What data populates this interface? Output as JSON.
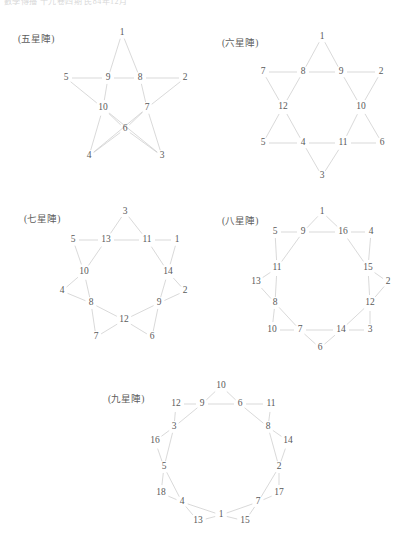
{
  "page": {
    "clipped_header": "數學傳播 十九卷四期 民84年12月",
    "background_color": "#ffffff",
    "edge_color": "#c9c9c9",
    "label_color": "#5a5a5a"
  },
  "figures": [
    {
      "id": "pentagram",
      "caption": "(五星陣)",
      "caption_x": 18,
      "caption_y": 38,
      "origin_x": 0,
      "origin_y": 0,
      "width": 208,
      "height": 180,
      "nodes": [
        {
          "label": "1",
          "x": 122,
          "y": 33
        },
        {
          "label": "5",
          "x": 66,
          "y": 78
        },
        {
          "label": "9",
          "x": 108,
          "y": 78
        },
        {
          "label": "8",
          "x": 140,
          "y": 78
        },
        {
          "label": "2",
          "x": 185,
          "y": 78
        },
        {
          "label": "10",
          "x": 103,
          "y": 108
        },
        {
          "label": "7",
          "x": 147,
          "y": 108
        },
        {
          "label": "6",
          "x": 125,
          "y": 129
        },
        {
          "label": "4",
          "x": 89,
          "y": 156
        },
        {
          "label": "3",
          "x": 162,
          "y": 156
        }
      ],
      "edges": [
        [
          "1",
          "9"
        ],
        [
          "1",
          "8"
        ],
        [
          "5",
          "9"
        ],
        [
          "9",
          "8"
        ],
        [
          "8",
          "2"
        ],
        [
          "5",
          "10"
        ],
        [
          "2",
          "7"
        ],
        [
          "9",
          "10"
        ],
        [
          "8",
          "7"
        ],
        [
          "10",
          "6"
        ],
        [
          "7",
          "6"
        ],
        [
          "10",
          "4"
        ],
        [
          "10",
          "3"
        ],
        [
          "7",
          "4"
        ],
        [
          "7",
          "3"
        ],
        [
          "6",
          "4"
        ],
        [
          "6",
          "3"
        ]
      ]
    },
    {
      "id": "hexagram",
      "caption": "(六星陣)",
      "caption_x": 222,
      "caption_y": 42,
      "origin_x": 208,
      "origin_y": 0,
      "width": 208,
      "height": 190,
      "nodes": [
        {
          "label": "1",
          "x": 322,
          "y": 37
        },
        {
          "label": "7",
          "x": 263,
          "y": 72
        },
        {
          "label": "8",
          "x": 303,
          "y": 72
        },
        {
          "label": "9",
          "x": 341,
          "y": 72
        },
        {
          "label": "2",
          "x": 381,
          "y": 72
        },
        {
          "label": "12",
          "x": 283,
          "y": 107
        },
        {
          "label": "10",
          "x": 361,
          "y": 107
        },
        {
          "label": "5",
          "x": 263,
          "y": 143
        },
        {
          "label": "4",
          "x": 303,
          "y": 143
        },
        {
          "label": "11",
          "x": 343,
          "y": 143
        },
        {
          "label": "6",
          "x": 382,
          "y": 143
        },
        {
          "label": "3",
          "x": 322,
          "y": 176
        }
      ],
      "edges": [
        [
          "1",
          "8"
        ],
        [
          "1",
          "9"
        ],
        [
          "7",
          "8"
        ],
        [
          "8",
          "9"
        ],
        [
          "9",
          "2"
        ],
        [
          "7",
          "12"
        ],
        [
          "8",
          "12"
        ],
        [
          "9",
          "10"
        ],
        [
          "2",
          "10"
        ],
        [
          "12",
          "5"
        ],
        [
          "12",
          "4"
        ],
        [
          "10",
          "11"
        ],
        [
          "10",
          "6"
        ],
        [
          "5",
          "4"
        ],
        [
          "4",
          "11"
        ],
        [
          "11",
          "6"
        ],
        [
          "4",
          "3"
        ],
        [
          "11",
          "3"
        ]
      ]
    },
    {
      "id": "heptagram",
      "caption": "(七星陣)",
      "caption_x": 24,
      "caption_y": 218,
      "origin_x": 0,
      "origin_y": 200,
      "width": 208,
      "height": 150,
      "nodes": [
        {
          "label": "3",
          "x": 125,
          "y": 212
        },
        {
          "label": "5",
          "x": 73,
          "y": 240
        },
        {
          "label": "13",
          "x": 106,
          "y": 240
        },
        {
          "label": "11",
          "x": 147,
          "y": 240
        },
        {
          "label": "1",
          "x": 177,
          "y": 240
        },
        {
          "label": "10",
          "x": 84,
          "y": 272
        },
        {
          "label": "14",
          "x": 168,
          "y": 272
        },
        {
          "label": "4",
          "x": 62,
          "y": 291
        },
        {
          "label": "2",
          "x": 185,
          "y": 291
        },
        {
          "label": "8",
          "x": 91,
          "y": 303
        },
        {
          "label": "9",
          "x": 159,
          "y": 303
        },
        {
          "label": "12",
          "x": 124,
          "y": 320
        },
        {
          "label": "7",
          "x": 96,
          "y": 337
        },
        {
          "label": "6",
          "x": 152,
          "y": 337
        }
      ],
      "edges": [
        [
          "3",
          "13"
        ],
        [
          "3",
          "11"
        ],
        [
          "5",
          "13"
        ],
        [
          "13",
          "11"
        ],
        [
          "11",
          "1"
        ],
        [
          "5",
          "10"
        ],
        [
          "13",
          "10"
        ],
        [
          "11",
          "14"
        ],
        [
          "1",
          "14"
        ],
        [
          "10",
          "4"
        ],
        [
          "10",
          "8"
        ],
        [
          "14",
          "2"
        ],
        [
          "14",
          "9"
        ],
        [
          "4",
          "8"
        ],
        [
          "2",
          "9"
        ],
        [
          "8",
          "7"
        ],
        [
          "8",
          "12"
        ],
        [
          "9",
          "6"
        ],
        [
          "9",
          "12"
        ],
        [
          "7",
          "12"
        ],
        [
          "6",
          "12"
        ]
      ]
    },
    {
      "id": "octagram",
      "caption": "(八星陣)",
      "caption_x": 222,
      "caption_y": 220,
      "origin_x": 208,
      "origin_y": 200,
      "width": 208,
      "height": 160,
      "nodes": [
        {
          "label": "1",
          "x": 322,
          "y": 212
        },
        {
          "label": "5",
          "x": 275,
          "y": 232
        },
        {
          "label": "9",
          "x": 303,
          "y": 232
        },
        {
          "label": "16",
          "x": 343,
          "y": 232
        },
        {
          "label": "4",
          "x": 371,
          "y": 232
        },
        {
          "label": "11",
          "x": 277,
          "y": 268
        },
        {
          "label": "15",
          "x": 368,
          "y": 268
        },
        {
          "label": "13",
          "x": 256,
          "y": 282
        },
        {
          "label": "2",
          "x": 388,
          "y": 282
        },
        {
          "label": "8",
          "x": 275,
          "y": 303
        },
        {
          "label": "12",
          "x": 370,
          "y": 303
        },
        {
          "label": "10",
          "x": 272,
          "y": 330
        },
        {
          "label": "7",
          "x": 300,
          "y": 330
        },
        {
          "label": "14",
          "x": 341,
          "y": 330
        },
        {
          "label": "3",
          "x": 370,
          "y": 330
        },
        {
          "label": "6",
          "x": 320,
          "y": 348
        }
      ],
      "edges": [
        [
          "1",
          "9"
        ],
        [
          "1",
          "16"
        ],
        [
          "5",
          "9"
        ],
        [
          "9",
          "16"
        ],
        [
          "16",
          "4"
        ],
        [
          "5",
          "11"
        ],
        [
          "9",
          "11"
        ],
        [
          "16",
          "15"
        ],
        [
          "4",
          "15"
        ],
        [
          "11",
          "13"
        ],
        [
          "11",
          "8"
        ],
        [
          "15",
          "2"
        ],
        [
          "15",
          "12"
        ],
        [
          "13",
          "8"
        ],
        [
          "2",
          "12"
        ],
        [
          "8",
          "10"
        ],
        [
          "8",
          "7"
        ],
        [
          "12",
          "3"
        ],
        [
          "12",
          "14"
        ],
        [
          "10",
          "7"
        ],
        [
          "7",
          "14"
        ],
        [
          "14",
          "3"
        ],
        [
          "7",
          "6"
        ],
        [
          "14",
          "6"
        ]
      ]
    },
    {
      "id": "nonagram",
      "caption": "(九星陣)",
      "caption_x": 108,
      "caption_y": 398,
      "origin_x": 100,
      "origin_y": 375,
      "width": 220,
      "height": 176,
      "nodes": [
        {
          "label": "10",
          "x": 221,
          "y": 386
        },
        {
          "label": "12",
          "x": 176,
          "y": 404
        },
        {
          "label": "9",
          "x": 202,
          "y": 404
        },
        {
          "label": "6",
          "x": 240,
          "y": 404
        },
        {
          "label": "11",
          "x": 271,
          "y": 404
        },
        {
          "label": "3",
          "x": 174,
          "y": 427
        },
        {
          "label": "8",
          "x": 268,
          "y": 427
        },
        {
          "label": "16",
          "x": 155,
          "y": 441
        },
        {
          "label": "14",
          "x": 288,
          "y": 441
        },
        {
          "label": "5",
          "x": 164,
          "y": 467
        },
        {
          "label": "2",
          "x": 279,
          "y": 467
        },
        {
          "label": "18",
          "x": 161,
          "y": 493
        },
        {
          "label": "17",
          "x": 279,
          "y": 493
        },
        {
          "label": "4",
          "x": 182,
          "y": 502
        },
        {
          "label": "7",
          "x": 258,
          "y": 502
        },
        {
          "label": "13",
          "x": 198,
          "y": 521
        },
        {
          "label": "1",
          "x": 221,
          "y": 515
        },
        {
          "label": "15",
          "x": 245,
          "y": 521
        }
      ],
      "edges": [
        [
          "10",
          "9"
        ],
        [
          "10",
          "6"
        ],
        [
          "12",
          "9"
        ],
        [
          "9",
          "6"
        ],
        [
          "6",
          "11"
        ],
        [
          "12",
          "3"
        ],
        [
          "9",
          "3"
        ],
        [
          "6",
          "8"
        ],
        [
          "11",
          "8"
        ],
        [
          "3",
          "16"
        ],
        [
          "3",
          "5"
        ],
        [
          "8",
          "14"
        ],
        [
          "8",
          "2"
        ],
        [
          "16",
          "5"
        ],
        [
          "14",
          "2"
        ],
        [
          "5",
          "18"
        ],
        [
          "5",
          "4"
        ],
        [
          "2",
          "17"
        ],
        [
          "2",
          "7"
        ],
        [
          "18",
          "4"
        ],
        [
          "17",
          "7"
        ],
        [
          "4",
          "13"
        ],
        [
          "4",
          "1"
        ],
        [
          "7",
          "15"
        ],
        [
          "7",
          "1"
        ],
        [
          "13",
          "1"
        ],
        [
          "1",
          "15"
        ]
      ]
    }
  ]
}
